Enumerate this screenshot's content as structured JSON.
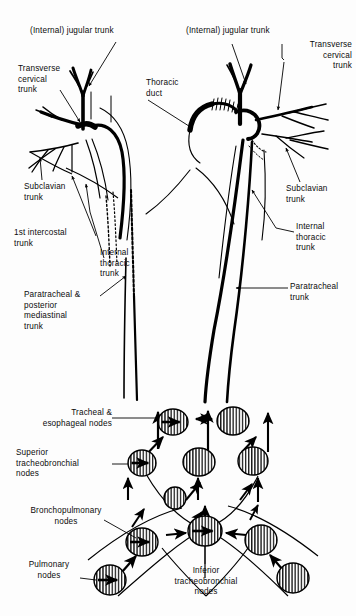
{
  "figure": {
    "type": "anatomical-diagram",
    "background_color": "#fdfdfd",
    "ink_color": "#000000",
    "width": 356,
    "height": 616
  },
  "labels": {
    "jugular_trunk_left": "(Internal) jugular trunk",
    "jugular_trunk_right": "(Internal) jugular trunk",
    "transverse_cervical_trunk_left": "Transverse\ncervical\ntrunk",
    "transverse_cervical_trunk_right": "Transverse\ncervical\ntrunk",
    "thoracic_duct": "Thoracic\nduct",
    "subclavian_trunk_left": "Subclavian\ntrunk",
    "subclavian_trunk_right": "Subclavian\ntrunk",
    "first_intercostal_trunk": "1st intercostal\ntrunk",
    "internal_thoracic_trunk_left": "Internal\nthoracic\ntrunk",
    "internal_thoracic_trunk_right": "Internal\nthoracic\ntrunk",
    "paratracheal_posterior_mediastinal_trunk": "Paratracheal &\nposterior\nmediastinal\ntrunk",
    "paratracheal_trunk": "Paratracheal\ntrunk",
    "tracheal_esophageal_nodes": "Tracheal &\nesophageal nodes",
    "superior_tracheobronchial_nodes": "Superior\ntracheobronchial\nnodes",
    "bronchopulmonary_nodes": "Bronchopulmonary\nnodes",
    "pulmonary_nodes": "Pulmonary\nnodes",
    "inferior_tracheobronchial_nodes": "Inferior\ntracheobronchial\nnodes"
  },
  "nodes": [
    {
      "name": "tracheal-esophageal-node-left",
      "cx": 173,
      "cy": 422,
      "rx": 15,
      "ry": 13,
      "inner_arrow": true
    },
    {
      "name": "tracheal-esophageal-node-right",
      "cx": 233,
      "cy": 421,
      "rx": 16,
      "ry": 14,
      "inner_arrow": false
    },
    {
      "name": "superior-tracheobronchial-node-left",
      "cx": 142,
      "cy": 463,
      "rx": 14,
      "ry": 13,
      "inner_arrow": true
    },
    {
      "name": "superior-tracheobronchial-node-mid",
      "cx": 199,
      "cy": 462,
      "rx": 16,
      "ry": 14,
      "inner_arrow": false
    },
    {
      "name": "superior-tracheobronchial-node-right",
      "cx": 253,
      "cy": 461,
      "rx": 15,
      "ry": 14,
      "inner_arrow": false
    },
    {
      "name": "paratracheal-small-node",
      "cx": 175,
      "cy": 498,
      "rx": 11,
      "ry": 11,
      "inner_arrow": false
    },
    {
      "name": "bronchopulmonary-node-left",
      "cx": 142,
      "cy": 542,
      "rx": 16,
      "ry": 14,
      "inner_arrow": true
    },
    {
      "name": "inferior-tracheobronchial-node-mid",
      "cx": 205,
      "cy": 531,
      "rx": 17,
      "ry": 15,
      "inner_arrow": true
    },
    {
      "name": "bronchopulmonary-node-right",
      "cx": 261,
      "cy": 540,
      "rx": 16,
      "ry": 15,
      "inner_arrow": false
    },
    {
      "name": "pulmonary-node-left",
      "cx": 110,
      "cy": 580,
      "rx": 16,
      "ry": 15,
      "inner_arrow": true
    },
    {
      "name": "pulmonary-node-right",
      "cx": 293,
      "cy": 578,
      "rx": 16,
      "ry": 15,
      "inner_arrow": false
    }
  ],
  "legend": {
    "node_fill_pattern": "vertical-hatch",
    "arrow_meaning": "lymph flow direction"
  }
}
